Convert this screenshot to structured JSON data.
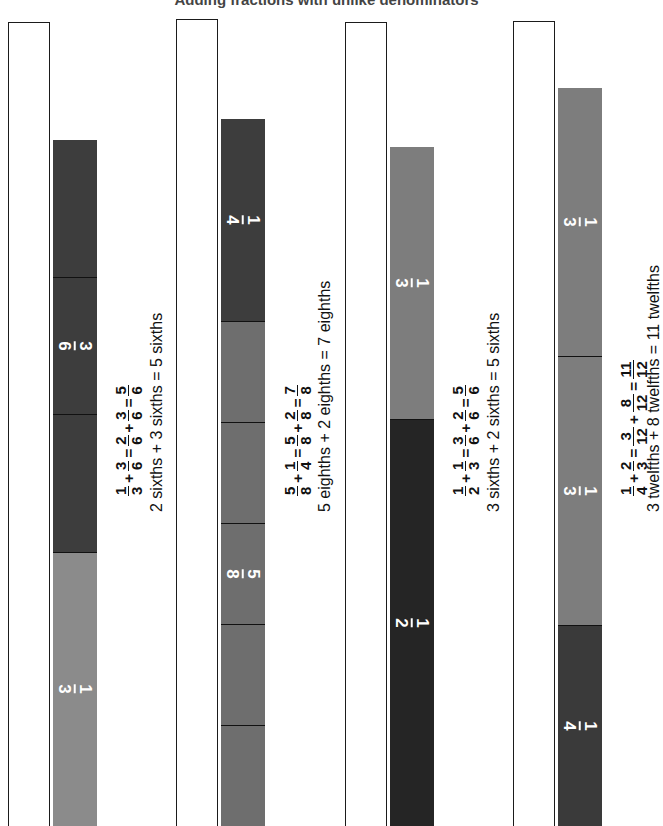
{
  "page": {
    "title": "Adding fractions with unlike denominators",
    "background": "#ffffff",
    "width": 653,
    "height": 826,
    "rotation_note": "content rotated 90 degrees"
  },
  "palette": {
    "outline": "#1b1b1b",
    "light_gray": "#8b8b8b",
    "medium_gray": "#6e6e6e",
    "dark_gray": "#3d3d3d",
    "near_black": "#252525",
    "label_text": "#ffffff",
    "body_text": "#111111"
  },
  "rows": [
    {
      "id": "row-1",
      "bar_segments": [
        {
          "label_num": "1",
          "label_den": "3",
          "label": "1/3",
          "color": "#8b8b8b",
          "fraction": 0.3333,
          "show_label": true,
          "divider": false
        },
        {
          "label_num": "3",
          "label_den": "6",
          "label": "3/6",
          "color": "#3d3d3d",
          "fraction": 0.1667,
          "show_label": false,
          "divider": true
        },
        {
          "label_num": "3",
          "label_den": "6",
          "label": "3/6",
          "color": "#3d3d3d",
          "fraction": 0.1667,
          "show_label": true,
          "divider": true
        },
        {
          "label_num": "3",
          "label_den": "6",
          "label": "3/6",
          "color": "#3d3d3d",
          "fraction": 0.1667,
          "show_label": false,
          "divider": true
        }
      ],
      "equation": {
        "terms": [
          {
            "type": "fraction",
            "num": "1",
            "den": "3"
          },
          {
            "type": "op",
            "text": "+"
          },
          {
            "type": "fraction",
            "num": "3",
            "den": "6"
          },
          {
            "type": "op",
            "text": "="
          },
          {
            "type": "fraction",
            "num": "2",
            "den": "6"
          },
          {
            "type": "op",
            "text": "+"
          },
          {
            "type": "fraction",
            "num": "3",
            "den": "6"
          },
          {
            "type": "op",
            "text": "="
          },
          {
            "type": "fraction",
            "num": "5",
            "den": "6"
          }
        ]
      },
      "words": "2 sixths + 3 sixths = 5 sixths"
    },
    {
      "id": "row-2",
      "bar_segments": [
        {
          "label_num": "5",
          "label_den": "8",
          "label": "5/8",
          "color": "#6e6e6e",
          "fraction": 0.125,
          "show_label": false,
          "divider": true
        },
        {
          "label_num": "5",
          "label_den": "8",
          "label": "5/8",
          "color": "#6e6e6e",
          "fraction": 0.125,
          "show_label": false,
          "divider": true
        },
        {
          "label_num": "5",
          "label_den": "8",
          "label": "5/8",
          "color": "#6e6e6e",
          "fraction": 0.125,
          "show_label": true,
          "divider": true
        },
        {
          "label_num": "5",
          "label_den": "8",
          "label": "5/8",
          "color": "#6e6e6e",
          "fraction": 0.125,
          "show_label": false,
          "divider": true
        },
        {
          "label_num": "5",
          "label_den": "8",
          "label": "5/8",
          "color": "#6e6e6e",
          "fraction": 0.125,
          "show_label": false,
          "divider": true
        },
        {
          "label_num": "1",
          "label_den": "4",
          "label": "1/4",
          "color": "#3d3d3d",
          "fraction": 0.25,
          "show_label": true,
          "divider": true
        }
      ],
      "equation": {
        "terms": [
          {
            "type": "fraction",
            "num": "5",
            "den": "8"
          },
          {
            "type": "op",
            "text": "+"
          },
          {
            "type": "fraction",
            "num": "1",
            "den": "4"
          },
          {
            "type": "op",
            "text": "="
          },
          {
            "type": "fraction",
            "num": "5",
            "den": "8"
          },
          {
            "type": "op",
            "text": "+"
          },
          {
            "type": "fraction",
            "num": "2",
            "den": "8"
          },
          {
            "type": "op",
            "text": "="
          },
          {
            "type": "fraction",
            "num": "7",
            "den": "8"
          }
        ]
      },
      "words": "5 eighths + 2 eighths = 7 eighths"
    },
    {
      "id": "row-3",
      "bar_segments": [
        {
          "label_num": "1",
          "label_den": "2",
          "label": "1/2",
          "color": "#252525",
          "fraction": 0.5,
          "show_label": true,
          "divider": false
        },
        {
          "label_num": "1",
          "label_den": "3",
          "label": "1/3",
          "color": "#7d7d7d",
          "fraction": 0.3333,
          "show_label": true,
          "divider": true
        }
      ],
      "equation": {
        "terms": [
          {
            "type": "fraction",
            "num": "1",
            "den": "2"
          },
          {
            "type": "op",
            "text": "+"
          },
          {
            "type": "fraction",
            "num": "1",
            "den": "3"
          },
          {
            "type": "op",
            "text": "="
          },
          {
            "type": "fraction",
            "num": "3",
            "den": "6"
          },
          {
            "type": "op",
            "text": "+"
          },
          {
            "type": "fraction",
            "num": "2",
            "den": "6"
          },
          {
            "type": "op",
            "text": "="
          },
          {
            "type": "fraction",
            "num": "5",
            "den": "6"
          }
        ]
      },
      "words": "3 sixths + 2 sixths = 5 sixths"
    },
    {
      "id": "row-4",
      "bar_segments": [
        {
          "label_num": "1",
          "label_den": "4",
          "label": "1/4",
          "color": "#3a3a3a",
          "fraction": 0.25,
          "show_label": true,
          "divider": false
        },
        {
          "label_num": "1",
          "label_den": "3",
          "label": "1/3",
          "color": "#7d7d7d",
          "fraction": 0.3333,
          "show_label": true,
          "divider": true
        },
        {
          "label_num": "1",
          "label_den": "3",
          "label": "1/3",
          "color": "#7d7d7d",
          "fraction": 0.3333,
          "show_label": true,
          "divider": true
        }
      ],
      "equation": {
        "terms": [
          {
            "type": "fraction",
            "num": "1",
            "den": "4"
          },
          {
            "type": "op",
            "text": "+"
          },
          {
            "type": "fraction",
            "num": "2",
            "den": "3"
          },
          {
            "type": "op",
            "text": "="
          },
          {
            "type": "fraction",
            "num": "3",
            "den": "12"
          },
          {
            "type": "op",
            "text": "+"
          },
          {
            "type": "fraction",
            "num": "8",
            "den": "12"
          },
          {
            "type": "op",
            "text": "="
          },
          {
            "type": "fraction",
            "num": "11",
            "den": "12"
          }
        ]
      },
      "words": "3 twelfths + 8 twelfths = 11 twelfths"
    }
  ]
}
